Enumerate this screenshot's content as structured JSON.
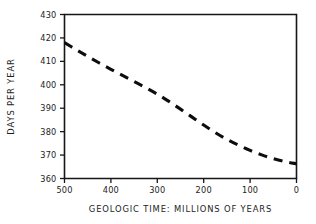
{
  "chart_data": {
    "type": "line",
    "title": "",
    "xlabel": "GEOLOGIC TIME: MILLIONS OF YEARS",
    "ylabel": "DAYS PER YEAR",
    "xlim": [
      500,
      0
    ],
    "ylim": [
      360,
      430
    ],
    "x_reversed": true,
    "grid": false,
    "legend": null,
    "line_style": "dashed",
    "line_color": "#0d0d0d",
    "xticks": [
      500,
      400,
      300,
      200,
      100,
      0
    ],
    "xtick_labels": [
      "500",
      "400",
      "300",
      "200",
      "100",
      "0"
    ],
    "yticks": [
      360,
      370,
      380,
      390,
      400,
      410,
      420,
      430
    ],
    "ytick_labels": [
      "360",
      "370",
      "380",
      "390",
      "400",
      "410",
      "420",
      "430"
    ],
    "x": [
      500,
      475,
      450,
      425,
      400,
      375,
      350,
      325,
      300,
      275,
      250,
      225,
      200,
      175,
      150,
      125,
      100,
      75,
      50,
      25,
      0
    ],
    "values": [
      418.0,
      415.0,
      412.1,
      409.3,
      406.6,
      404.0,
      401.4,
      398.8,
      396.0,
      392.9,
      389.6,
      386.2,
      382.8,
      379.6,
      376.7,
      374.2,
      372.0,
      370.1,
      368.5,
      367.2,
      366.3
    ],
    "series": [
      {
        "name": "Days per year",
        "values": [
          418.0,
          415.0,
          412.1,
          409.3,
          406.6,
          404.0,
          401.4,
          398.8,
          396.0,
          392.9,
          389.6,
          386.2,
          382.8,
          379.6,
          376.7,
          374.2,
          372.0,
          370.1,
          368.5,
          367.2,
          366.3
        ]
      }
    ]
  },
  "axes": {
    "x_title": "GEOLOGIC TIME: MILLIONS OF YEARS",
    "y_title": "DAYS PER YEAR"
  }
}
